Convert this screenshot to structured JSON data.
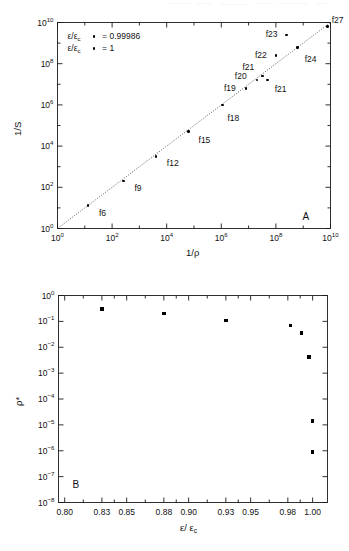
{
  "figure": {
    "width": 349,
    "height": 551,
    "background": "#ffffff",
    "ink": "#000000",
    "panel_a_id": "A",
    "panel_b_id": "B"
  },
  "chart_data": [
    {
      "type": "scatter",
      "panel": "A",
      "title": "",
      "xlabel": "1/ρ",
      "ylabel": "1/S",
      "xscale": "log",
      "yscale": "log",
      "xlim": [
        1,
        10000000000.0
      ],
      "ylim": [
        1,
        10000000000.0
      ],
      "grid": false,
      "xticklabels": [
        "10⁰",
        "10²",
        "10⁴",
        "10⁶",
        "10⁸",
        "10¹⁰"
      ],
      "xtickvalues": [
        1,
        100,
        10000,
        1000000,
        100000000,
        10000000000
      ],
      "yticklabels": [
        "10⁰",
        "10²",
        "10⁴",
        "10⁶",
        "10⁸",
        "10¹⁰"
      ],
      "ytickvalues": [
        1,
        100,
        10000,
        1000000,
        100000000,
        10000000000
      ],
      "legend_position": "upper-left",
      "legend": [
        {
          "label": "ε/ε",
          "sub": "c",
          "marker": "dot",
          "equals": "= 0.99986"
        },
        {
          "label": "ε/ε",
          "sub": "c",
          "marker": "dot",
          "equals": "= 1"
        }
      ],
      "reference_line": {
        "style": "dotted",
        "slope": 1,
        "intercept": 0,
        "from": [
          1,
          1
        ],
        "to": [
          10000000000.0,
          10000000000.0
        ]
      },
      "points": [
        {
          "name": "f6",
          "x": 13.0,
          "y": 13.0,
          "label": "f6",
          "label_dx": 11,
          "label_dy": 7
        },
        {
          "name": "f9",
          "x": 260.0,
          "y": 200.0,
          "label": "f9",
          "label_dx": 11,
          "label_dy": 7
        },
        {
          "name": "f12",
          "x": 4000.0,
          "y": 3200.0,
          "label": "f12",
          "label_dx": 11,
          "label_dy": 7
        },
        {
          "name": "f15",
          "x": 63000.0,
          "y": 50000.0,
          "label": "f15",
          "label_dx": 10,
          "label_dy": 8
        },
        {
          "name": "f18",
          "x": 1100000.0,
          "y": 1000000.0,
          "label": "f18",
          "label_dx": 5,
          "label_dy": 13
        },
        {
          "name": "f19",
          "x": 8000000.0,
          "y": 6300000.0,
          "label": "f19",
          "label_dx": -22,
          "label_dy": 0
        },
        {
          "name": "f20",
          "x": 20000000.0,
          "y": 16000000.0,
          "label": "f20",
          "label_dx": -22,
          "label_dy": -4
        },
        {
          "name": "f21",
          "x": 32000000.0,
          "y": 25000000.0,
          "label": "f21",
          "label_dx": -20,
          "label_dy": -9
        },
        {
          "name": "f21b",
          "x": 50000000.0,
          "y": 16000000.0,
          "label": "f21",
          "label_dx": 7,
          "label_dy": 9
        },
        {
          "name": "f22",
          "x": 100000000.0,
          "y": 250000000.0,
          "label": "f22",
          "label_dx": -21,
          "label_dy": -1
        },
        {
          "name": "f23",
          "x": 250000000.0,
          "y": 2500000000.0,
          "label": "f23",
          "label_dx": -21,
          "label_dy": -1
        },
        {
          "name": "f24",
          "x": 630000000.0,
          "y": 630000000.0,
          "label": "f24",
          "label_dx": 7,
          "label_dy": 12
        },
        {
          "name": "f27",
          "x": 7900000000.0,
          "y": 6300000000.0,
          "label": "f27",
          "label_dx": 4,
          "label_dy": -7
        }
      ]
    },
    {
      "type": "scatter",
      "panel": "B",
      "title": "",
      "xlabel": "ε/ ε",
      "xlabel_sub": "c",
      "ylabel": "ρ*",
      "xscale": "linear",
      "yscale": "log",
      "xlim": [
        0.795,
        1.012
      ],
      "ylim": [
        1e-08,
        1
      ],
      "grid": false,
      "xticklabels": [
        "0.80",
        "0.83",
        "0.85",
        "0.88",
        "0.90",
        "0.93",
        "0.95",
        "0.98",
        "1.00"
      ],
      "xtickvalues": [
        0.8,
        0.83,
        0.85,
        0.88,
        0.9,
        0.93,
        0.95,
        0.98,
        1.0
      ],
      "yticklabels": [
        "10⁰",
        "10⁻¹",
        "10⁻²",
        "10⁻³",
        "10⁻⁴",
        "10⁻⁵",
        "10⁻⁶",
        "10⁻⁷",
        "10⁻⁸"
      ],
      "ytickvalues": [
        1,
        0.1,
        0.01,
        0.001,
        0.0001,
        1e-05,
        1e-06,
        1e-07,
        1e-08
      ],
      "points": [
        {
          "x": 0.83,
          "y": 0.3
        },
        {
          "x": 0.88,
          "y": 0.2
        },
        {
          "x": 0.93,
          "y": 0.11
        },
        {
          "x": 0.982,
          "y": 0.07
        },
        {
          "x": 0.991,
          "y": 0.035
        },
        {
          "x": 0.997,
          "y": 0.0042
        },
        {
          "x": 1.0,
          "y": 1.4e-05
        },
        {
          "x": 1.0,
          "y": 9e-07
        }
      ]
    }
  ]
}
